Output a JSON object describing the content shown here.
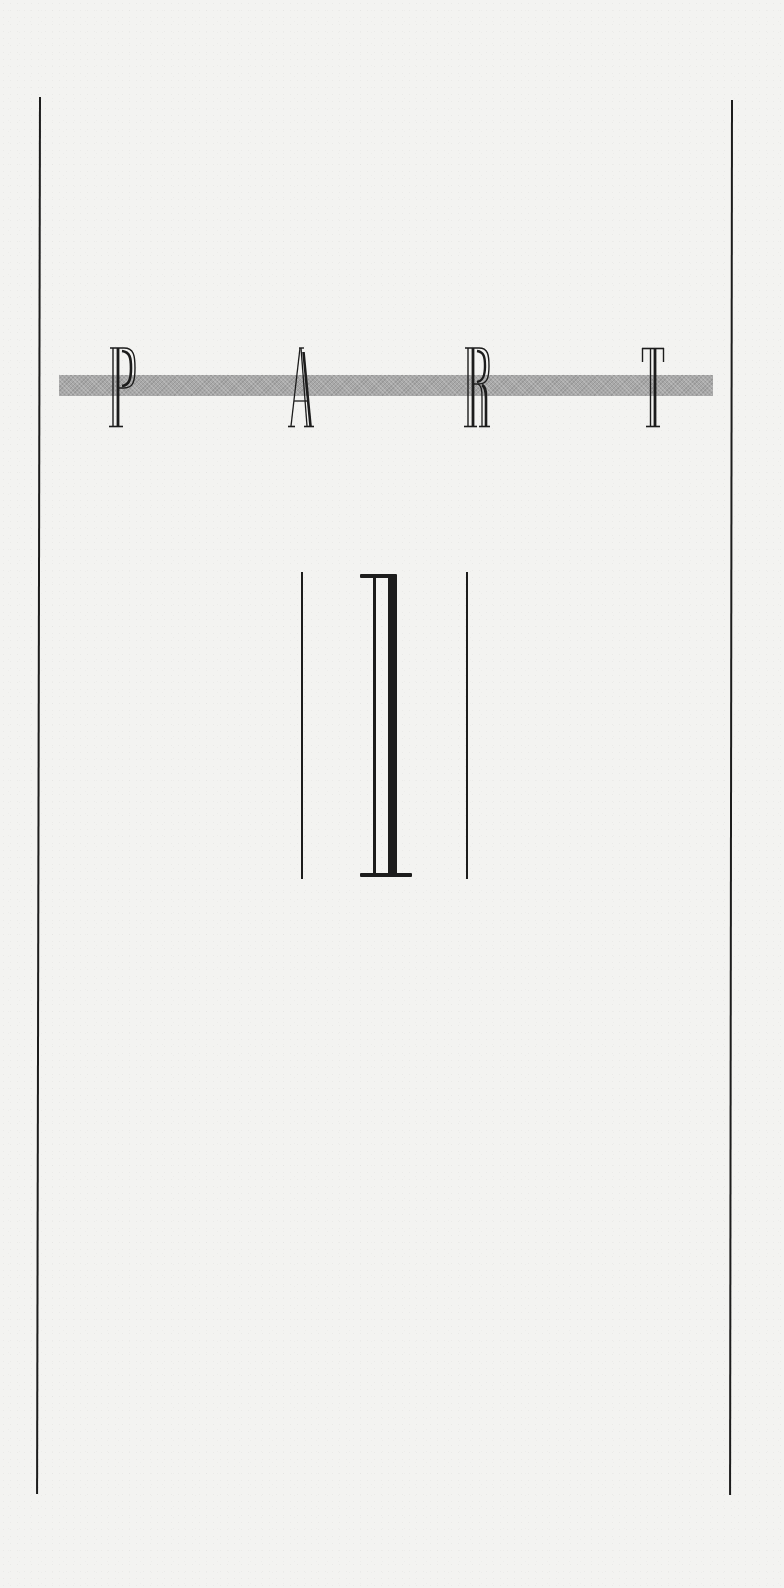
{
  "page": {
    "type": "part-title-page",
    "background_color": "#f3f3f1",
    "ink_color": "#1c1c1c",
    "band_color": "#a8a8a8"
  },
  "heading": {
    "word": "PART",
    "letters": [
      "P",
      "A",
      "R",
      "T"
    ]
  },
  "part_number": {
    "numeral": "I"
  }
}
